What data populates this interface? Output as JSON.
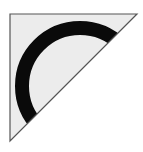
{
  "tile": {
    "shape": "right-triangle",
    "fill_color": "#ececec",
    "stroke_color": "#555555",
    "arc_color": "#0a0a0a",
    "vertices": [
      [
        10,
        14
      ],
      [
        137,
        14
      ],
      [
        10,
        141
      ]
    ],
    "arc": {
      "center": [
        80,
        86
      ],
      "outer_radius": 65,
      "inner_radius": 51
    }
  }
}
